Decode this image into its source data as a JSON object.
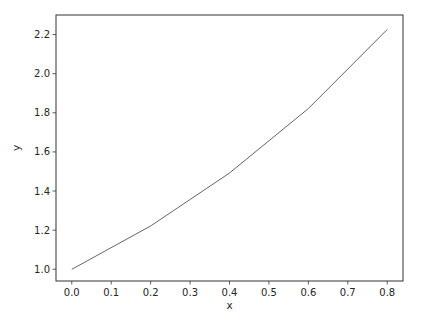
{
  "chart_data": {
    "type": "line",
    "title": "",
    "xlabel": "x",
    "ylabel": "y",
    "xlim": [
      -0.04,
      0.84
    ],
    "ylim": [
      0.94,
      2.3
    ],
    "grid": false,
    "legend": null,
    "x_ticks": [
      "0.0",
      "0.1",
      "0.2",
      "0.3",
      "0.4",
      "0.5",
      "0.6",
      "0.7",
      "0.8"
    ],
    "y_ticks": [
      "1.0",
      "1.2",
      "1.4",
      "1.6",
      "1.8",
      "2.0",
      "2.2"
    ],
    "series": [
      {
        "name": "y",
        "color": "#666666",
        "x": [
          0.0,
          0.2,
          0.4,
          0.6,
          0.8
        ],
        "values": [
          1.0,
          1.221,
          1.492,
          1.822,
          2.226
        ]
      }
    ]
  }
}
